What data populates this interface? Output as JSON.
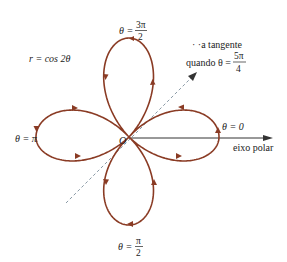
{
  "figure": {
    "equation": "r = cos 2θ",
    "colors": {
      "curve": "#8a3b24",
      "axis": "#333333",
      "tangent": "#8a9aa6",
      "text": "#222222"
    },
    "labels": {
      "theta_3pi_2": {
        "prefix": "θ =",
        "num": "3π",
        "den": "2"
      },
      "theta_pi_2": {
        "prefix": "θ =",
        "num": "π",
        "den": "2"
      },
      "theta_pi": "θ = π",
      "theta_0": "θ = 0",
      "origin": "O",
      "polar_axis": "eixo polar",
      "tangent_line1": "· ·a tangente",
      "tangent_line2": {
        "prefix": "quando θ =",
        "num": "5π",
        "den": "4"
      }
    }
  }
}
